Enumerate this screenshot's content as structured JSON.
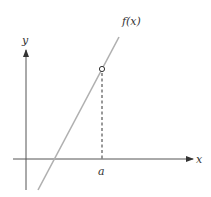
{
  "diagram": {
    "labels": {
      "y_axis": "y",
      "x_axis": "x",
      "function": "f(x)",
      "point": "a"
    },
    "colors": {
      "axes": "#333333",
      "curve": "#b0b0b0",
      "dashed": "#333333",
      "hole_fill": "#ffffff",
      "hole_stroke": "#333333",
      "background": "#ffffff"
    },
    "elements": {
      "curve": "straight line with positive slope",
      "hole": "open circle on line above x = a",
      "guide": "vertical dashed line from hole to x-axis at a"
    }
  }
}
